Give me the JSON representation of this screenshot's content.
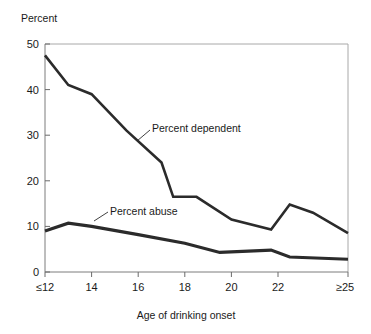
{
  "chart_data": {
    "type": "line",
    "title": "",
    "ylabel": "Percent",
    "xlabel": "Age of drinking onset",
    "ylim": [
      0,
      50
    ],
    "yticks": [
      0,
      10,
      20,
      30,
      40,
      50
    ],
    "ytick_labels": [
      "0",
      "10",
      "20",
      "30",
      "40",
      "50"
    ],
    "xticks": [
      12,
      14,
      16,
      18,
      20,
      22,
      25
    ],
    "xtick_labels": [
      "≤12",
      "14",
      "16",
      "18",
      "20",
      "22",
      "≥25"
    ],
    "xlim": [
      12,
      25
    ],
    "grid": false,
    "legend_position": "inline-annotation",
    "series": [
      {
        "name": "Percent dependent",
        "color": "#2b2b2b",
        "x": [
          12,
          13,
          14,
          15.5,
          17,
          17.5,
          18.5,
          20,
          21.7,
          22.5,
          23.5,
          25
        ],
        "values": [
          47.5,
          41.0,
          39.0,
          31.0,
          24.0,
          16.5,
          16.5,
          11.5,
          9.3,
          14.8,
          13.0,
          8.5
        ]
      },
      {
        "name": "Percent abuse",
        "color": "#2b2b2b",
        "x": [
          12,
          13,
          14,
          16,
          18,
          19.5,
          21.7,
          22.5,
          25
        ],
        "values": [
          9.0,
          10.7,
          10.0,
          8.2,
          6.3,
          4.3,
          4.8,
          3.3,
          2.8
        ]
      }
    ],
    "annotations": [
      {
        "text": "Percent dependent",
        "x_label": 15.9,
        "y_label": 31.2
      },
      {
        "text": "Percent abuse",
        "x_label": 14.4,
        "y_label": 13.7
      }
    ]
  }
}
